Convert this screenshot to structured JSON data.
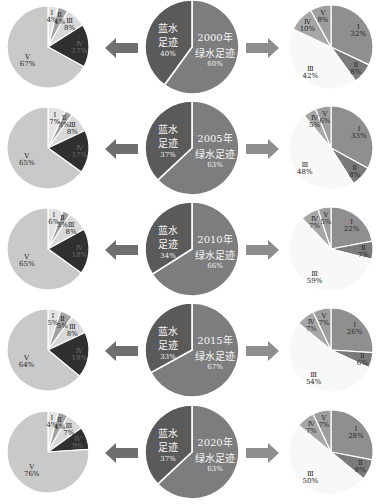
{
  "figure": {
    "years": [
      "2000",
      "2005",
      "2010",
      "2015",
      "2020"
    ],
    "arrows": {
      "left_icon": "arrow-left",
      "right_icon": "arrow-right"
    }
  },
  "palette": {
    "blue_water_composition": [
      "#e3e3e3",
      "#a2a2a2",
      "#d8d8d8",
      "#303030",
      "#c9c9c9"
    ],
    "total": {
      "blue_water": "#5a5a5a",
      "green_water": "#7d7d7d"
    },
    "green_water_composition": [
      "#8f8f8f",
      "#7a7a7a",
      "#f8f8f8",
      "#a7a7a7",
      "#9e9e9e"
    ],
    "arrow_left": "#6f6f6f",
    "arrow_right": "#8e8e8e",
    "label_text": "#2a2a2a",
    "total_label_text": "#f4f4f4"
  },
  "chart_data": [
    {
      "type": "pie",
      "year": "2000",
      "panel": "blue-water-composition",
      "categories": [
        "Ⅰ",
        "Ⅱ",
        "Ⅲ",
        "Ⅳ",
        "Ⅴ"
      ],
      "values": [
        4,
        4,
        8,
        17,
        67
      ],
      "value_labels": [
        "4%",
        "4%",
        "8%",
        "17%",
        "67%"
      ]
    },
    {
      "type": "pie",
      "year": "2000",
      "panel": "total",
      "year_label": "2000年",
      "categories": [
        "蓝水足迹",
        "绿水足迹"
      ],
      "category_lines": [
        [
          "蓝水",
          "足迹"
        ],
        [
          "绿水足迹"
        ]
      ],
      "values": [
        40,
        60
      ],
      "value_labels": [
        "40%",
        "60%"
      ]
    },
    {
      "type": "pie",
      "year": "2000",
      "panel": "green-water-composition",
      "categories": [
        "Ⅰ",
        "Ⅱ",
        "Ⅲ",
        "Ⅳ",
        "Ⅴ"
      ],
      "values": [
        32,
        8,
        42,
        10,
        8
      ],
      "value_labels": [
        "32%",
        "8%",
        "42%",
        "10%",
        "8%"
      ]
    },
    {
      "type": "pie",
      "year": "2005",
      "panel": "blue-water-composition",
      "categories": [
        "Ⅰ",
        "Ⅱ",
        "Ⅲ",
        "Ⅳ",
        "Ⅴ"
      ],
      "values": [
        7,
        3,
        8,
        17,
        65
      ],
      "value_labels": [
        "7%",
        "3%",
        "8%",
        "17%",
        "65%"
      ]
    },
    {
      "type": "pie",
      "year": "2005",
      "panel": "total",
      "year_label": "2005年",
      "categories": [
        "蓝水足迹",
        "绿水足迹"
      ],
      "category_lines": [
        [
          "蓝水",
          "足迹"
        ],
        [
          "绿水足迹"
        ]
      ],
      "values": [
        37,
        63
      ],
      "value_labels": [
        "37%",
        "63%"
      ]
    },
    {
      "type": "pie",
      "year": "2005",
      "panel": "green-water-composition",
      "categories": [
        "Ⅰ",
        "Ⅱ",
        "Ⅲ",
        "Ⅳ",
        "Ⅴ"
      ],
      "values": [
        33,
        8,
        48,
        5,
        6
      ],
      "value_labels": [
        "33%",
        "8%",
        "48%",
        "5%",
        "6%"
      ]
    },
    {
      "type": "pie",
      "year": "2010",
      "panel": "blue-water-composition",
      "categories": [
        "Ⅰ",
        "Ⅱ",
        "Ⅲ",
        "Ⅳ",
        "Ⅴ"
      ],
      "values": [
        6,
        3,
        8,
        18,
        65
      ],
      "value_labels": [
        "6%",
        "3%",
        "8%",
        "18%",
        "65%"
      ]
    },
    {
      "type": "pie",
      "year": "2010",
      "panel": "total",
      "year_label": "2010年",
      "categories": [
        "蓝水足迹",
        "绿水足迹"
      ],
      "category_lines": [
        [
          "蓝水",
          "足迹"
        ],
        [
          "绿水足迹"
        ]
      ],
      "values": [
        34,
        66
      ],
      "value_labels": [
        "34%",
        "66%"
      ]
    },
    {
      "type": "pie",
      "year": "2010",
      "panel": "green-water-composition",
      "categories": [
        "Ⅰ",
        "Ⅱ",
        "Ⅲ",
        "Ⅳ",
        "Ⅴ"
      ],
      "values": [
        22,
        7,
        59,
        7,
        5
      ],
      "value_labels": [
        "22%",
        "7%",
        "59%",
        "7%",
        "5%"
      ]
    },
    {
      "type": "pie",
      "year": "2015",
      "panel": "blue-water-composition",
      "categories": [
        "Ⅰ",
        "Ⅱ",
        "Ⅲ",
        "Ⅳ",
        "Ⅴ"
      ],
      "values": [
        5,
        5,
        8,
        18,
        64
      ],
      "value_labels": [
        "5%",
        "5%",
        "8%",
        "18%",
        "64%"
      ]
    },
    {
      "type": "pie",
      "year": "2015",
      "panel": "total",
      "year_label": "2015年",
      "categories": [
        "蓝水足迹",
        "绿水足迹"
      ],
      "category_lines": [
        [
          "蓝水",
          "足迹"
        ],
        [
          "绿水足迹"
        ]
      ],
      "values": [
        33,
        67
      ],
      "value_labels": [
        "33%",
        "67%"
      ]
    },
    {
      "type": "pie",
      "year": "2015",
      "panel": "green-water-composition",
      "categories": [
        "Ⅰ",
        "Ⅱ",
        "Ⅲ",
        "Ⅳ",
        "Ⅴ"
      ],
      "values": [
        26,
        6,
        54,
        7,
        7
      ],
      "value_labels": [
        "26%",
        "6%",
        "54%",
        "7%",
        "7%"
      ]
    },
    {
      "type": "pie",
      "year": "2020",
      "panel": "blue-water-composition",
      "categories": [
        "Ⅰ",
        "Ⅱ",
        "Ⅲ",
        "Ⅳ",
        "Ⅴ"
      ],
      "values": [
        4,
        4,
        7,
        9,
        76
      ],
      "value_labels": [
        "4%",
        "4%",
        "7%",
        "9%",
        "76%"
      ]
    },
    {
      "type": "pie",
      "year": "2020",
      "panel": "total",
      "year_label": "2020年",
      "categories": [
        "蓝水足迹",
        "绿水足迹"
      ],
      "category_lines": [
        [
          "蓝水",
          "足迹"
        ],
        [
          "绿水足迹"
        ]
      ],
      "values": [
        37,
        63
      ],
      "value_labels": [
        "37%",
        "63%"
      ]
    },
    {
      "type": "pie",
      "year": "2020",
      "panel": "green-water-composition",
      "categories": [
        "Ⅰ",
        "Ⅱ",
        "Ⅲ",
        "Ⅳ",
        "Ⅴ"
      ],
      "values": [
        28,
        8,
        50,
        7,
        7
      ],
      "value_labels": [
        "28%",
        "8%",
        "50%",
        "7%",
        "7%"
      ]
    }
  ]
}
